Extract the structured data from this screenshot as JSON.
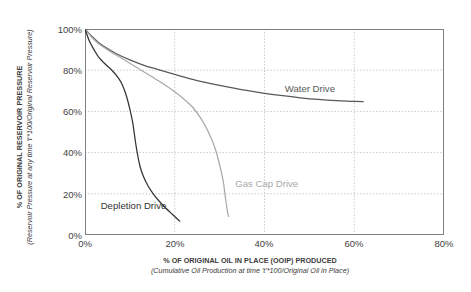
{
  "chart_data": {
    "type": "line",
    "title": "",
    "xlabel": "% OF ORIGINAL OIL IN PLACE (OOIP) PRODUCED",
    "xlabel_sub": "(Cumulative Oil Production at time 't'*100/Original Oil in Place)",
    "ylabel": "% OF ORIGINAL RESERVOIR PRESSURE",
    "ylabel_sub": "(Reservoir Pressure at any time 't'*100/Original Reservoir Pressure)",
    "xlim": [
      0,
      80
    ],
    "ylim": [
      0,
      100
    ],
    "xticks": [
      0,
      20,
      40,
      60,
      80
    ],
    "xtick_labels": [
      "0%",
      "20%",
      "40%",
      "60%",
      "80%"
    ],
    "yticks": [
      0,
      20,
      40,
      60,
      80,
      100
    ],
    "ytick_labels": [
      "0%",
      "20%",
      "40%",
      "60%",
      "80%",
      "100%"
    ],
    "grid": "horizontal-and-vertical-dotted",
    "legend": "inline-annotations",
    "series": [
      {
        "name": "Water Drive",
        "color": "#595959",
        "label_x": 44.5,
        "label_y": 70.5,
        "points": [
          [
            0,
            100
          ],
          [
            1.5,
            96.5
          ],
          [
            3,
            93.5
          ],
          [
            5,
            90.5
          ],
          [
            7,
            88
          ],
          [
            10,
            85
          ],
          [
            13,
            82.5
          ],
          [
            16,
            80.5
          ],
          [
            20,
            78
          ],
          [
            24,
            75.5
          ],
          [
            28,
            73.5
          ],
          [
            32,
            71.8
          ],
          [
            36,
            70.2
          ],
          [
            40,
            68.8
          ],
          [
            44,
            67.6
          ],
          [
            48,
            66.6
          ],
          [
            52,
            65.8
          ],
          [
            56,
            65.2
          ],
          [
            59,
            64.9
          ],
          [
            62,
            64.7
          ]
        ]
      },
      {
        "name": "Gas Cap Drive",
        "color": "#a9a9a9",
        "label_x": 33.5,
        "label_y": 24.5,
        "points": [
          [
            0,
            100
          ],
          [
            1.5,
            96
          ],
          [
            3,
            93
          ],
          [
            5,
            90
          ],
          [
            8,
            86
          ],
          [
            11,
            82
          ],
          [
            14,
            78
          ],
          [
            17,
            74
          ],
          [
            20,
            69.5
          ],
          [
            22,
            66
          ],
          [
            24,
            62
          ],
          [
            26,
            56
          ],
          [
            27.5,
            50
          ],
          [
            29,
            42
          ],
          [
            30,
            34
          ],
          [
            30.8,
            26
          ],
          [
            31.3,
            18
          ],
          [
            31.7,
            12
          ],
          [
            32,
            9
          ]
        ]
      },
      {
        "name": "Depletion Drive",
        "color": "#333333",
        "label_x": 3.5,
        "label_y": 13.5,
        "points": [
          [
            0,
            100
          ],
          [
            1,
            94
          ],
          [
            2,
            90
          ],
          [
            3,
            86.5
          ],
          [
            4.5,
            83
          ],
          [
            6,
            80
          ],
          [
            7.5,
            76
          ],
          [
            8.5,
            72
          ],
          [
            9.3,
            67
          ],
          [
            10,
            61
          ],
          [
            10.6,
            55
          ],
          [
            11,
            49
          ],
          [
            11.4,
            43
          ],
          [
            11.8,
            38
          ],
          [
            12.3,
            33
          ],
          [
            13,
            28.5
          ],
          [
            14,
            24
          ],
          [
            15.2,
            20
          ],
          [
            16.5,
            16.5
          ],
          [
            17.8,
            13.5
          ],
          [
            19,
            11
          ],
          [
            20,
            9
          ],
          [
            20.7,
            7.5
          ],
          [
            21.1,
            6.8
          ]
        ]
      }
    ]
  },
  "axes": {
    "border_color": "#7f7f7f",
    "gridline_color": "#c8c8c8"
  }
}
